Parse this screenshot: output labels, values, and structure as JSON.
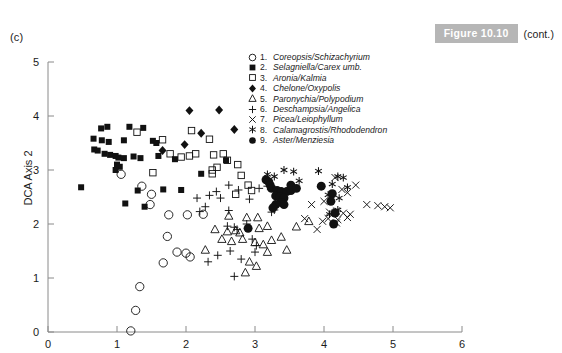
{
  "panel": {
    "label": "(c)"
  },
  "figure_banner": {
    "title": "Figure 10.10",
    "cont": "(cont.)",
    "banner_color": "#b6b6b6",
    "banner_text_color": "#ffffff"
  },
  "chart_data": {
    "type": "scatter",
    "title": "",
    "xlabel": "",
    "ylabel": "DCA Axis 2",
    "xlim": [
      0,
      6
    ],
    "ylim": [
      0,
      5
    ],
    "xticks": [
      0,
      1,
      2,
      3,
      4,
      5,
      6
    ],
    "yticks": [
      0,
      1,
      2,
      3,
      4,
      5
    ],
    "xtick_labels": [
      "0",
      "1",
      "2",
      "3",
      "4",
      "5",
      "6"
    ],
    "ytick_labels": [
      "0",
      "1",
      "2",
      "3",
      "4",
      "5"
    ],
    "grid": false,
    "legend_position": "top-center-right",
    "series": [
      {
        "name": "1. Coreopsis/Schizachyrium",
        "number": "1.",
        "marker": "open-circle",
        "points": [
          [
            1.06,
            2.92
          ],
          [
            1.36,
            2.7
          ],
          [
            1.5,
            2.55
          ],
          [
            1.48,
            2.36
          ],
          [
            1.75,
            2.17
          ],
          [
            2.02,
            2.17
          ],
          [
            2.25,
            2.18
          ],
          [
            1.73,
            1.77
          ],
          [
            1.87,
            1.48
          ],
          [
            2.0,
            1.46
          ],
          [
            2.06,
            1.39
          ],
          [
            1.67,
            1.28
          ],
          [
            1.33,
            0.84
          ],
          [
            1.27,
            0.4
          ],
          [
            1.2,
            0.02
          ]
        ]
      },
      {
        "name": "2. Selagniella/Carex umb.",
        "number": "2.",
        "marker": "filled-square",
        "points": [
          [
            0.77,
            3.77
          ],
          [
            0.86,
            3.8
          ],
          [
            1.18,
            3.8
          ],
          [
            1.38,
            3.78
          ],
          [
            0.66,
            3.58
          ],
          [
            0.78,
            3.55
          ],
          [
            0.88,
            3.52
          ],
          [
            1.1,
            3.55
          ],
          [
            1.52,
            3.54
          ],
          [
            1.57,
            3.5
          ],
          [
            0.67,
            3.38
          ],
          [
            0.72,
            3.36
          ],
          [
            0.82,
            3.3
          ],
          [
            0.9,
            3.28
          ],
          [
            0.98,
            3.26
          ],
          [
            1.02,
            3.23
          ],
          [
            1.1,
            3.22
          ],
          [
            1.24,
            3.25
          ],
          [
            1.0,
            3.1
          ],
          [
            1.04,
            3.06
          ],
          [
            0.98,
            3.0
          ],
          [
            1.34,
            3.22
          ],
          [
            1.6,
            3.26
          ],
          [
            1.84,
            3.2
          ],
          [
            0.48,
            2.68
          ],
          [
            1.3,
            2.62
          ],
          [
            1.67,
            2.64
          ],
          [
            1.93,
            2.63
          ],
          [
            1.12,
            2.38
          ],
          [
            1.4,
            2.32
          ],
          [
            2.22,
            2.93
          ],
          [
            2.58,
            3.18
          ]
        ]
      },
      {
        "name": "3. Aronia/Kalmia",
        "number": "3.",
        "marker": "open-square",
        "points": [
          [
            1.29,
            3.7
          ],
          [
            1.66,
            3.56
          ],
          [
            2.08,
            3.73
          ],
          [
            2.34,
            3.57
          ],
          [
            1.77,
            3.3
          ],
          [
            1.93,
            3.24
          ],
          [
            2.05,
            3.26
          ],
          [
            2.14,
            3.3
          ],
          [
            2.4,
            3.28
          ],
          [
            2.54,
            3.3
          ],
          [
            2.6,
            3.18
          ],
          [
            2.38,
            3.0
          ],
          [
            2.38,
            2.93
          ],
          [
            2.45,
            3.05
          ],
          [
            2.75,
            3.1
          ],
          [
            2.8,
            2.9
          ],
          [
            2.9,
            2.72
          ],
          [
            2.95,
            2.62
          ],
          [
            2.72,
            2.55
          ],
          [
            1.52,
            2.95
          ]
        ]
      },
      {
        "name": "4. Chelone/Oxypolis",
        "number": "4.",
        "marker": "filled-diamond",
        "points": [
          [
            2.05,
            4.1
          ],
          [
            2.48,
            4.11
          ],
          [
            2.7,
            3.75
          ],
          [
            2.22,
            3.68
          ],
          [
            1.98,
            3.47
          ],
          [
            1.66,
            3.36
          ]
        ]
      },
      {
        "name": "5. Paronychia/Polypodium",
        "number": "5.",
        "marker": "open-triangle",
        "points": [
          [
            2.62,
            2.15
          ],
          [
            2.88,
            2.12
          ],
          [
            3.04,
            2.12
          ],
          [
            2.42,
            1.9
          ],
          [
            2.6,
            1.86
          ],
          [
            2.72,
            1.88
          ],
          [
            2.78,
            1.84
          ],
          [
            2.52,
            1.72
          ],
          [
            2.82,
            1.72
          ],
          [
            3.0,
            1.66
          ],
          [
            3.12,
            1.62
          ],
          [
            3.24,
            1.7
          ],
          [
            3.38,
            1.76
          ],
          [
            3.18,
            1.48
          ],
          [
            3.46,
            1.52
          ],
          [
            2.28,
            1.52
          ],
          [
            2.92,
            1.3
          ],
          [
            3.02,
            1.22
          ],
          [
            2.86,
            1.1
          ],
          [
            2.66,
            1.68
          ],
          [
            3.6,
            1.95
          ],
          [
            3.78,
            2.05
          ],
          [
            3.06,
            1.92
          ],
          [
            3.18,
            1.96
          ]
        ]
      },
      {
        "name": "6. Deschampsia/Angelica",
        "number": "6.",
        "marker": "plus",
        "points": [
          [
            2.62,
            2.72
          ],
          [
            2.44,
            2.6
          ],
          [
            2.34,
            2.53
          ],
          [
            2.5,
            2.48
          ],
          [
            2.76,
            2.63
          ],
          [
            3.06,
            2.66
          ],
          [
            3.18,
            2.7
          ],
          [
            3.3,
            2.62
          ],
          [
            2.92,
            2.46
          ],
          [
            2.28,
            2.32
          ],
          [
            2.62,
            2.25
          ],
          [
            2.88,
            2.0
          ],
          [
            2.6,
            1.96
          ],
          [
            2.7,
            1.94
          ],
          [
            2.74,
            1.9
          ],
          [
            2.96,
            1.72
          ],
          [
            3.02,
            1.6
          ],
          [
            2.64,
            1.5
          ],
          [
            2.46,
            1.42
          ],
          [
            2.8,
            1.35
          ],
          [
            2.32,
            1.3
          ],
          [
            2.7,
            1.03
          ],
          [
            3.0,
            1.48
          ],
          [
            3.24,
            2.22
          ],
          [
            3.28,
            2.26
          ],
          [
            2.16,
            2.48
          ],
          [
            2.2,
            2.23
          ]
        ]
      },
      {
        "name": "7. Picea/Leiophyllum",
        "number": "7.",
        "marker": "cross",
        "points": [
          [
            4.08,
            2.22
          ],
          [
            4.18,
            2.24
          ],
          [
            4.28,
            2.2
          ],
          [
            4.38,
            2.18
          ],
          [
            4.62,
            2.36
          ],
          [
            4.78,
            2.34
          ],
          [
            4.88,
            2.32
          ],
          [
            4.96,
            2.3
          ],
          [
            4.06,
            2.1
          ],
          [
            4.2,
            2.08
          ],
          [
            4.34,
            2.12
          ],
          [
            4.18,
            2.02
          ],
          [
            3.98,
            2.05
          ],
          [
            3.72,
            2.1
          ],
          [
            3.9,
            1.9
          ],
          [
            3.82,
            2.36
          ],
          [
            4.0,
            2.42
          ],
          [
            4.26,
            2.64
          ],
          [
            4.34,
            2.58
          ],
          [
            4.16,
            2.86
          ],
          [
            4.46,
            2.72
          ]
        ]
      },
      {
        "name": "8. Calamagrostis/Rhododendron",
        "number": "8.",
        "marker": "asterisk",
        "points": [
          [
            3.42,
            3.0
          ],
          [
            3.56,
            2.97
          ],
          [
            3.92,
            2.98
          ],
          [
            4.2,
            2.88
          ],
          [
            4.28,
            2.86
          ],
          [
            4.12,
            2.74
          ],
          [
            4.34,
            2.68
          ],
          [
            3.28,
            2.88
          ],
          [
            3.64,
            2.8
          ],
          [
            4.06,
            2.54
          ],
          [
            4.22,
            2.48
          ],
          [
            4.2,
            2.26
          ],
          [
            4.08,
            2.18
          ],
          [
            3.18,
            2.92
          ]
        ]
      },
      {
        "name": "9. Aster/Menziesia",
        "number": "9.",
        "marker": "filled-circle",
        "points": [
          [
            3.16,
            2.82
          ],
          [
            3.2,
            2.78
          ],
          [
            3.22,
            2.72
          ],
          [
            3.24,
            2.66
          ],
          [
            3.32,
            2.62
          ],
          [
            3.38,
            2.6
          ],
          [
            3.46,
            2.6
          ],
          [
            3.52,
            2.62
          ],
          [
            3.3,
            2.52
          ],
          [
            3.36,
            2.5
          ],
          [
            3.42,
            2.48
          ],
          [
            3.38,
            2.4
          ],
          [
            3.42,
            2.36
          ],
          [
            3.3,
            2.36
          ],
          [
            3.26,
            2.3
          ],
          [
            3.96,
            2.7
          ],
          [
            4.12,
            2.56
          ],
          [
            4.1,
            2.42
          ],
          [
            4.16,
            2.2
          ],
          [
            4.14,
            2.0
          ],
          [
            2.9,
            1.92
          ],
          [
            3.52,
            2.72
          ],
          [
            3.6,
            2.66
          ]
        ]
      }
    ],
    "legend_entries": [
      {
        "number": "1.",
        "marker": "open-circle",
        "label": "Coreopsis/Schizachyrium"
      },
      {
        "number": "2.",
        "marker": "filled-square",
        "label": "Selagniella/Carex umb."
      },
      {
        "number": "3.",
        "marker": "open-square",
        "label": "Aronia/Kalmia"
      },
      {
        "number": "4.",
        "marker": "filled-diamond",
        "label": "Chelone/Oxypolis"
      },
      {
        "number": "5.",
        "marker": "open-triangle",
        "label": "Paronychia/Polypodium"
      },
      {
        "number": "6.",
        "marker": "plus",
        "label": "Deschampsia/Angelica"
      },
      {
        "number": "7.",
        "marker": "cross",
        "label": "Picea/Leiophyllum"
      },
      {
        "number": "8.",
        "marker": "asterisk",
        "label": "Calamagrostis/Rhododendron"
      },
      {
        "number": "9.",
        "marker": "filled-circle",
        "label": "Aster/Menziesia"
      }
    ]
  }
}
